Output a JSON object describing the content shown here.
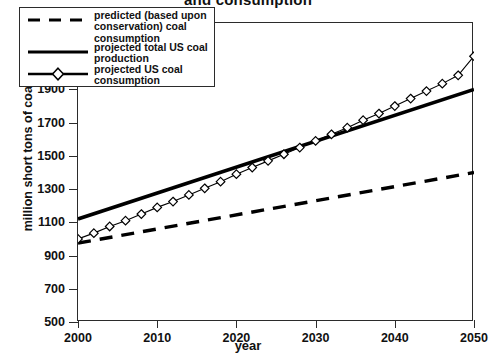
{
  "chart_data": {
    "type": "line",
    "title": "and consumption",
    "xlabel": "year",
    "ylabel": "million short tons of coal",
    "xlim": [
      2000,
      2050
    ],
    "ylim": [
      500,
      2300
    ],
    "xticks": [
      2000,
      2010,
      2020,
      2030,
      2040,
      2050
    ],
    "yticks": [
      500,
      700,
      900,
      1100,
      1300,
      1500,
      1700,
      1900,
      2100,
      2300
    ],
    "grid": false,
    "legend_position": "top-left",
    "series": [
      {
        "name": "predicted (based upon conservation) coal consumption",
        "style": "dashed",
        "marker": "none",
        "color": "#000000",
        "x": [
          2000,
          2050
        ],
        "values": [
          975,
          1400
        ]
      },
      {
        "name": "projected total US coal production",
        "style": "solid",
        "marker": "none",
        "color": "#000000",
        "x": [
          2000,
          2050
        ],
        "values": [
          1120,
          1900
        ]
      },
      {
        "name": "projected US coal consumption",
        "style": "solid-thin",
        "marker": "diamond",
        "color": "#000000",
        "x": [
          2000,
          2002,
          2004,
          2006,
          2008,
          2010,
          2012,
          2014,
          2016,
          2018,
          2020,
          2022,
          2024,
          2026,
          2028,
          2030,
          2032,
          2034,
          2036,
          2038,
          2040,
          2042,
          2044,
          2046,
          2048,
          2050
        ],
        "values": [
          1000,
          1035,
          1075,
          1110,
          1150,
          1190,
          1225,
          1265,
          1305,
          1345,
          1390,
          1430,
          1470,
          1510,
          1550,
          1590,
          1630,
          1670,
          1715,
          1755,
          1800,
          1845,
          1890,
          1935,
          1985,
          2100
        ]
      }
    ]
  },
  "legend": {
    "items": [
      {
        "label": "predicted (based upon conservation) coal consumption"
      },
      {
        "label": "projected total US coal production"
      },
      {
        "label": "projected US coal consumption"
      }
    ]
  }
}
